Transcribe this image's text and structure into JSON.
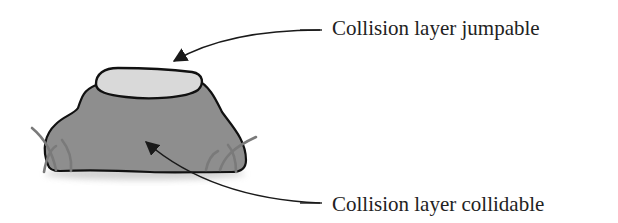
{
  "diagram": {
    "labels": {
      "jumpable": "Collision layer jumpable",
      "collidable": "Collision layer collidable"
    },
    "colors": {
      "rock_body": "#8e8e8e",
      "rock_top": "#d9d9d9",
      "outline": "#111111",
      "grass": "#7a7a7a",
      "arrow": "#1a1a1a",
      "text": "#222222",
      "background": "#ffffff"
    }
  }
}
